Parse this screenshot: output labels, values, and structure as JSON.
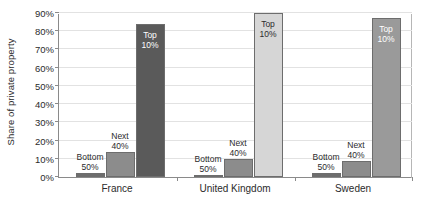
{
  "chart_data": {
    "type": "bar",
    "title": "",
    "xlabel": "",
    "ylabel": "Share of private property",
    "ylim": [
      0,
      90
    ],
    "grid": true,
    "legend": "none",
    "categories": [
      "France",
      "United Kingdom",
      "Sweden"
    ],
    "ytick_labels": [
      "0%",
      "10%",
      "20%",
      "30%",
      "40%",
      "50%",
      "60%",
      "70%",
      "80%",
      "90%"
    ],
    "ytick_values": [
      0,
      10,
      20,
      30,
      40,
      50,
      60,
      70,
      80,
      90
    ],
    "series": [
      {
        "name": "Bottom 50%",
        "label_line1": "Bottom",
        "label_line2": "50%",
        "color": "#6d6d6d",
        "values": [
          2,
          1,
          2
        ]
      },
      {
        "name": "Next 40%",
        "label_line1": "Next",
        "label_line2": "40%",
        "color": "#8c8c8c",
        "values": [
          14,
          10,
          9
        ]
      },
      {
        "name": "Top 10%",
        "label_line1": "Top",
        "label_line2": "10%",
        "color_by_group": [
          "#5a5a5a",
          "#d6d6d6",
          "#9a9a9a"
        ],
        "values": [
          84,
          90,
          87
        ]
      }
    ]
  },
  "axis": {
    "y_title": "Share of private property"
  }
}
